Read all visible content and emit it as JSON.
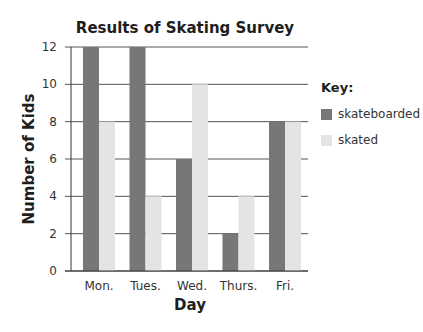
{
  "chart_data": {
    "type": "bar",
    "title": "Results of Skating Survey",
    "xlabel": "Day",
    "ylabel": "Number of Kids",
    "categories": [
      "Mon.",
      "Tues.",
      "Wed.",
      "Thurs.",
      "Fri."
    ],
    "series": [
      {
        "name": "skateboarded",
        "color": "#777777",
        "values": [
          12,
          12,
          6,
          2,
          8
        ]
      },
      {
        "name": "skated",
        "color": "#e4e4e4",
        "values": [
          8,
          4,
          10,
          4,
          8
        ]
      }
    ],
    "ylim": [
      0,
      12
    ],
    "yticks": [
      0,
      2,
      4,
      6,
      8,
      10,
      12
    ],
    "grid": true,
    "legend_position": "right",
    "legend_title": "Key:"
  }
}
